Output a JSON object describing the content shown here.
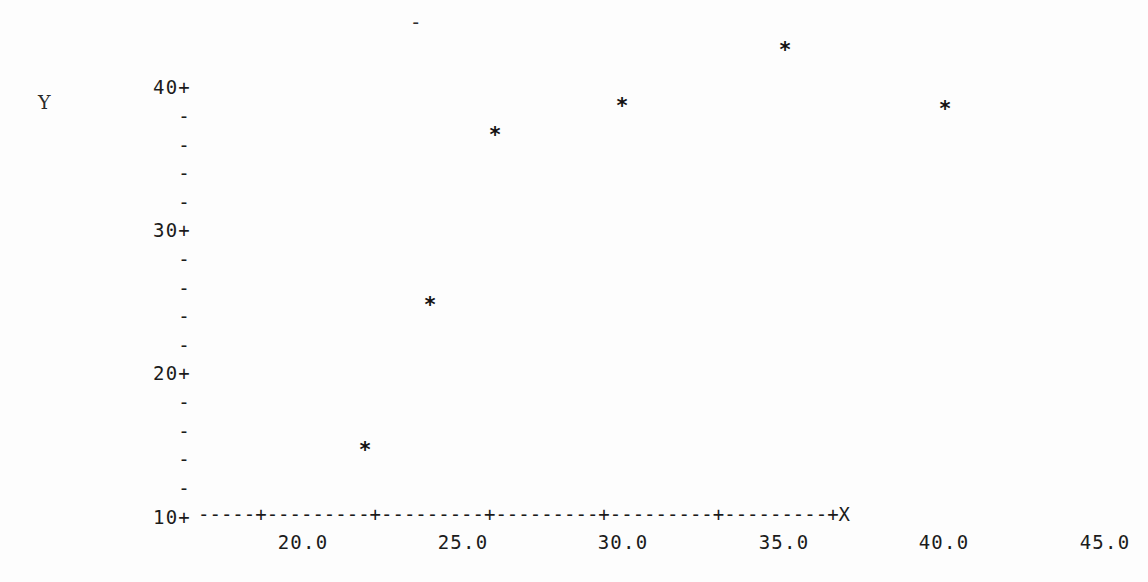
{
  "plot": {
    "type": "ascii-scatter",
    "marker_glyph": "*",
    "y_axis_title": "Y",
    "x_axis_title": "X",
    "overflow_tick_glyph": "-",
    "background_color": "#fdfdfd",
    "ink_color": "#1b1b1b"
  },
  "x_axis": {
    "rule": "-----+---------+---------+---------+---------+---------+X",
    "tick_labels": [
      "20.0",
      "25.0",
      "30.0",
      "35.0",
      "40.0",
      "45.0"
    ],
    "tick_values": [
      20.0,
      25.0,
      30.0,
      35.0,
      40.0,
      45.0
    ],
    "tick_px": [
      303,
      463,
      623,
      784,
      944,
      1105
    ],
    "end_label": "X"
  },
  "y_axis": {
    "rows": [
      {
        "label": "40+",
        "kind": "major",
        "value": 40,
        "px": 40
      },
      {
        "label": "-",
        "kind": "minor",
        "value": 38,
        "px": 69
      },
      {
        "label": "-",
        "kind": "minor",
        "value": 36,
        "px": 98
      },
      {
        "label": "-",
        "kind": "minor",
        "value": 34,
        "px": 126
      },
      {
        "label": "-",
        "kind": "minor",
        "value": 32,
        "px": 155
      },
      {
        "label": "30+",
        "kind": "major",
        "value": 30,
        "px": 183
      },
      {
        "label": "-",
        "kind": "minor",
        "value": 28,
        "px": 212
      },
      {
        "label": "-",
        "kind": "minor",
        "value": 26,
        "px": 241
      },
      {
        "label": "-",
        "kind": "minor",
        "value": 24,
        "px": 269
      },
      {
        "label": "-",
        "kind": "minor",
        "value": 22,
        "px": 298
      },
      {
        "label": "20+",
        "kind": "major",
        "value": 20,
        "px": 326
      },
      {
        "label": "-",
        "kind": "minor",
        "value": 18,
        "px": 355
      },
      {
        "label": "-",
        "kind": "minor",
        "value": 16,
        "px": 384
      },
      {
        "label": "-",
        "kind": "minor",
        "value": 14,
        "px": 412
      },
      {
        "label": "-",
        "kind": "minor",
        "value": 12,
        "px": 441
      },
      {
        "label": "10+",
        "kind": "major",
        "value": 10,
        "px": 470
      }
    ],
    "major_labels": [
      "40+",
      "30+",
      "20+",
      "10+"
    ],
    "major_values": [
      40,
      30,
      20,
      10
    ]
  },
  "chart_data": {
    "type": "scatter",
    "title": "",
    "subtitle": "",
    "xlabel": "X",
    "ylabel": "Y",
    "xlim": [
      18.0,
      46.0
    ],
    "ylim": [
      10.0,
      41.0
    ],
    "grid": false,
    "legend": null,
    "marker": "*",
    "x": [
      21.7,
      23.9,
      26.0,
      29.9,
      35.0,
      40.0
    ],
    "y": [
      12.0,
      22.1,
      33.9,
      35.9,
      39.9,
      35.8
    ],
    "points": [
      {
        "x": 21.7,
        "y": 12.0,
        "px": 365,
        "py": 450
      },
      {
        "x": 23.9,
        "y": 22.1,
        "px": 430,
        "py": 305
      },
      {
        "x": 26.0,
        "y": 33.9,
        "px": 495,
        "py": 135
      },
      {
        "x": 29.9,
        "y": 35.9,
        "px": 622,
        "py": 106
      },
      {
        "x": 35.0,
        "y": 39.9,
        "px": 785,
        "py": 50
      },
      {
        "x": 40.0,
        "y": 35.8,
        "px": 945,
        "py": 109
      }
    ],
    "annotations": [
      {
        "text": "-",
        "px": 417,
        "py": 21,
        "note": "axis overflow tick above plot area"
      }
    ]
  }
}
